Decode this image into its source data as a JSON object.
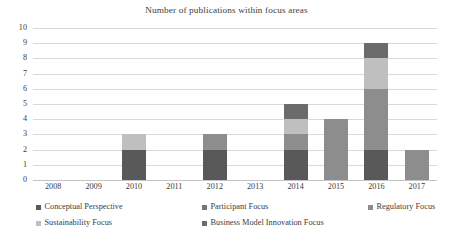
{
  "chart_data": {
    "type": "bar",
    "subtype": "stacked-column",
    "title": "Number of publications within focus areas",
    "xlabel": "",
    "ylabel": "",
    "categories": [
      "2008",
      "2009",
      "2010",
      "2011",
      "2012",
      "2013",
      "2014",
      "2015",
      "2016",
      "2017"
    ],
    "ylim": [
      0,
      10
    ],
    "ytick_labels": [
      "0",
      "1",
      "2",
      "3",
      "4",
      "5",
      "6",
      "7",
      "8",
      "9",
      "10"
    ],
    "ytick_values": [
      0,
      1,
      2,
      3,
      4,
      5,
      6,
      7,
      8,
      9,
      10
    ],
    "y_tick_step": 1,
    "grid": true,
    "grid_axis": "y",
    "legend_position": "bottom",
    "legend_columns": 3,
    "series": [
      {
        "name": "Conceptual Perspective",
        "color": "#595959",
        "values": [
          0,
          0,
          2,
          0,
          2,
          0,
          2,
          0,
          2,
          0
        ]
      },
      {
        "name": "Participant Focus",
        "color": "#767676",
        "values": [
          0,
          0,
          0,
          0,
          0,
          0,
          0,
          0,
          0,
          0
        ]
      },
      {
        "name": "Regulatory Focus",
        "color": "#8d8d8d",
        "values": [
          0,
          0,
          0,
          0,
          1,
          0,
          1,
          4,
          4,
          2
        ]
      },
      {
        "name": "Sustainability Focus",
        "color": "#bfbfbf",
        "values": [
          0,
          0,
          1,
          0,
          0,
          0,
          1,
          0,
          2,
          0
        ]
      },
      {
        "name": "Business Model Innovation Focus",
        "color": "#6b6b6b",
        "values": [
          0,
          0,
          0,
          0,
          0,
          0,
          1,
          0,
          1,
          0
        ]
      }
    ],
    "totals": [
      0,
      0,
      3,
      0,
      3,
      0,
      5,
      4,
      9,
      2
    ]
  },
  "legend": {
    "items": [
      {
        "label": "Conceptual Perspective",
        "color": "#595959"
      },
      {
        "label": "Participant Focus",
        "color": "#767676"
      },
      {
        "label": "Regulatory Focus",
        "color": "#8d8d8d"
      },
      {
        "label": "Sustainability Focus",
        "color": "#bfbfbf"
      },
      {
        "label": "Business Model Innovation Focus",
        "color": "#6b6b6b"
      }
    ]
  },
  "colors": {
    "gridline": "#d9d9d9",
    "text": "#3c3c3c",
    "background": "#ffffff"
  }
}
